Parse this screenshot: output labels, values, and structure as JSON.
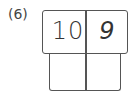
{
  "problem": {
    "label": "(6)",
    "top_cells": [
      "10",
      "9"
    ],
    "bottom_cells": [
      "",
      ""
    ]
  }
}
